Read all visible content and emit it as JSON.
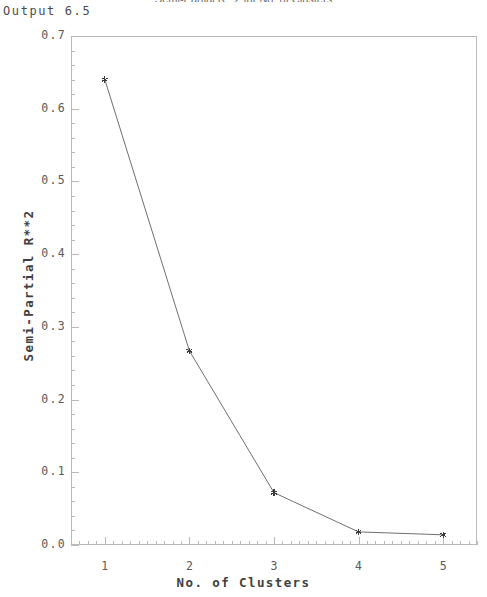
{
  "output_label": "Output 6.5",
  "chart_data": {
    "type": "line",
    "title": "Semi-Partial R**2 for No. of Clusters",
    "xlabel": "No. of Clusters",
    "ylabel": "Semi-Partial R**2",
    "x": [
      1,
      2,
      3,
      4,
      5
    ],
    "values": [
      0.64,
      0.267,
      0.072,
      0.018,
      0.014
    ],
    "series": [
      {
        "name": "Semi-Partial R**2",
        "values": [
          0.64,
          0.267,
          0.072,
          0.018,
          0.014
        ]
      }
    ],
    "xlim": [
      0.6,
      5.4
    ],
    "ylim": [
      0.0,
      0.7
    ],
    "xticks": [
      1,
      2,
      3,
      4,
      5
    ],
    "xtick_labels": [
      "1",
      "2",
      "3",
      "4",
      "5"
    ],
    "yticks": [
      0.0,
      0.1,
      0.2,
      0.3,
      0.4,
      0.5,
      0.6,
      0.7
    ],
    "ytick_labels": [
      "0.0",
      "0.1",
      "0.2",
      "0.3",
      "0.4",
      "0.5",
      "0.6",
      "0.7"
    ],
    "y_minor_tick_step": 0.02,
    "x_minor_tick_step": 0.1,
    "grid": false,
    "legend": "none",
    "marker": "asterisk",
    "line_color": "#707070",
    "marker_color": "#3a3a3a",
    "frame_color": "#b9b9b9",
    "background": "#ffffff"
  }
}
